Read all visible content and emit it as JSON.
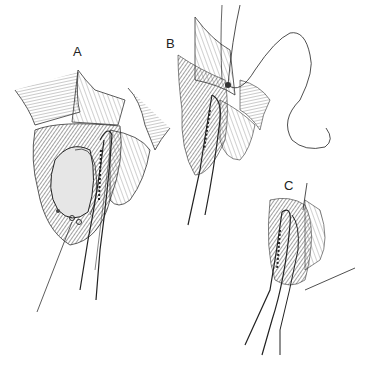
{
  "figure": {
    "panels": [
      {
        "label": "A",
        "content": "tissue mass grasped, curved clamp applied alongside, retractor at left"
      },
      {
        "label": "B",
        "content": "clamp in place with suture being passed and tied at the tip"
      },
      {
        "label": "C",
        "content": "curved clamp and forceps within incision, suture line exiting right"
      }
    ],
    "colors": {
      "ink": "#222222",
      "paper": "#ffffff",
      "shade": "#6e6e6e"
    }
  }
}
